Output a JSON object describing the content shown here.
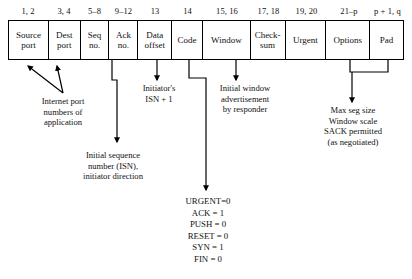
{
  "diagram": {
    "byte_offsets": [
      "1, 2",
      "3, 4",
      "5–8",
      "9–12",
      "13",
      "14",
      "15, 16",
      "17, 18",
      "19, 20",
      "21–p",
      "p + 1, q"
    ],
    "fields": [
      {
        "label": "Source\nport",
        "offset": "1, 2",
        "width": 40
      },
      {
        "label": "Dest\nport",
        "offset": "3, 4",
        "width": 32
      },
      {
        "label": "Seq\nno.",
        "offset": "5–8",
        "width": 29
      },
      {
        "label": "Ack\nno.",
        "offset": "9–12",
        "width": 29
      },
      {
        "label": "Data\noffset",
        "offset": "13",
        "width": 34
      },
      {
        "label": "Code",
        "offset": "14",
        "width": 31
      },
      {
        "label": "Window",
        "offset": "15, 16",
        "width": 48
      },
      {
        "label": "Check-\nsum",
        "offset": "17, 18",
        "width": 35
      },
      {
        "label": "Urgent",
        "offset": "19, 20",
        "width": 41
      },
      {
        "label": "Options",
        "offset": "21–p",
        "width": 44
      },
      {
        "label": "Pad",
        "offset": "p + 1, q",
        "width": 33
      }
    ],
    "annotations": {
      "ports": "Internet port\nnumbers of\napplication",
      "isn_plus_one": "Initiator's\nISN + 1",
      "initial_window": "Initial window\nadvertisement\nby responder",
      "options": "Max seg size\nWindow scale\nSACK permitted\n(as negotiated)",
      "sequence": "Initial sequence\nnumber (ISN),\ninitiator direction"
    },
    "code_flags": [
      "URGENT=0",
      "ACK = 1",
      "PUSH = 0",
      "RESET = 0",
      "SYN = 1",
      "FIN = 0"
    ],
    "colors": {
      "line": "#000000",
      "text": "#111111",
      "background": "#ffffff"
    }
  }
}
